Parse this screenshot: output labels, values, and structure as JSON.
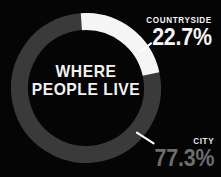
{
  "background_color": "#050505",
  "center_title": {
    "line1": "WHERE",
    "line2": "PEOPLE LIVE"
  },
  "callouts": {
    "countryside": {
      "name": "COUNTRYSIDE",
      "value": "22.7%"
    },
    "city": {
      "name": "CITY",
      "value": "77.3%"
    }
  },
  "chart_data": {
    "type": "pie",
    "variant": "donut",
    "title": "WHERE PEOPLE LIVE",
    "xlabel": "",
    "ylabel": "",
    "grid": false,
    "legend": "callout-labels",
    "units": "percent",
    "start_angle_deg": -4,
    "direction": "clockwise",
    "inner_radius_ratio": 0.775,
    "categories": [
      "COUNTRYSIDE",
      "CITY"
    ],
    "values": [
      22.7,
      77.3
    ],
    "labels": [
      "22.7%",
      "77.3%"
    ],
    "colors": [
      "#f5f5f5",
      "#3a3a3a"
    ],
    "slices": [
      {
        "name": "COUNTRYSIDE",
        "value": 22.7,
        "label": "22.7%",
        "color": "#f5f5f5",
        "label_color": "#f5f5f5"
      },
      {
        "name": "CITY",
        "value": 77.3,
        "label": "77.3%",
        "color": "#3a3a3a",
        "label_color": "#6d6d6d"
      }
    ]
  }
}
